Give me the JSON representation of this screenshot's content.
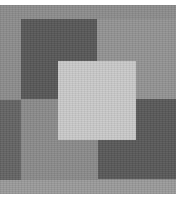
{
  "image": {
    "description": "Grayscale abstract composition of overlapping squares",
    "colors": {
      "background": "#8c8c8c",
      "top_left_square": "#575757",
      "top_right_region": "#939393",
      "left_strip": "#636363",
      "bottom_left_region": "#8a8a8a",
      "center_square": "#c9c9c9",
      "bottom_right_square": "#585858",
      "bottom_strip": "#9a9a9a"
    }
  }
}
